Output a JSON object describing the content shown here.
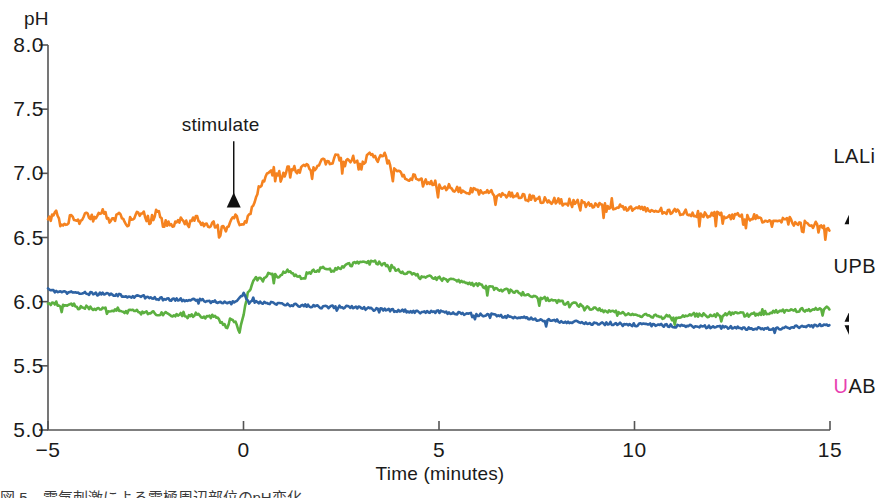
{
  "chart_data": {
    "type": "line",
    "title": "",
    "xlabel": "Time (minutes)",
    "ylabel": "pH",
    "ylabel_unit": "pH",
    "xlim": [
      -5,
      15
    ],
    "ylim": [
      5.0,
      8.0
    ],
    "grid": false,
    "legend_position": "right-inline-labels",
    "xticks": [
      -5,
      0,
      5,
      10,
      15
    ],
    "xtick_labels": [
      "−5",
      "0",
      "5",
      "10",
      "15"
    ],
    "yticks": [
      5.0,
      5.5,
      6.0,
      6.5,
      7.0,
      7.5,
      8.0
    ],
    "ytick_labels": [
      "5.0",
      "5.5",
      "6.0",
      "6.5",
      "7.0",
      "7.5",
      "8.0"
    ],
    "annotations": [
      {
        "text": "stimulate",
        "x": -0.25,
        "y": 7.35,
        "arrow_to_y": 6.85
      }
    ],
    "series": [
      {
        "name": "LALi",
        "color": "#F5821F",
        "label_x": 15.55,
        "label_y": 7.12,
        "arrow_from_y": 6.95,
        "arrow_to_y": 6.72,
        "x": [
          -5.0,
          -4.8,
          -4.6,
          -4.4,
          -4.2,
          -4.0,
          -3.8,
          -3.6,
          -3.4,
          -3.2,
          -3.0,
          -2.8,
          -2.6,
          -2.4,
          -2.2,
          -2.0,
          -1.8,
          -1.6,
          -1.4,
          -1.2,
          -1.0,
          -0.8,
          -0.6,
          -0.4,
          -0.2,
          0.0,
          0.2,
          0.4,
          0.6,
          0.8,
          1.0,
          1.2,
          1.4,
          1.6,
          1.8,
          2.0,
          2.2,
          2.4,
          2.6,
          2.8,
          3.0,
          3.2,
          3.4,
          3.6,
          3.8,
          4.0,
          4.2,
          4.4,
          4.6,
          4.8,
          5.0,
          5.5,
          6.0,
          6.5,
          7.0,
          7.5,
          8.0,
          8.5,
          9.0,
          9.5,
          10.0,
          10.5,
          11.0,
          11.5,
          12.0,
          12.5,
          13.0,
          13.5,
          14.0,
          14.5,
          15.0
        ],
        "y": [
          6.63,
          6.7,
          6.6,
          6.66,
          6.62,
          6.69,
          6.64,
          6.72,
          6.62,
          6.68,
          6.6,
          6.66,
          6.7,
          6.62,
          6.71,
          6.63,
          6.58,
          6.66,
          6.6,
          6.68,
          6.58,
          6.62,
          6.56,
          6.6,
          6.66,
          6.58,
          6.72,
          6.88,
          6.99,
          7.02,
          6.98,
          7.06,
          7.0,
          7.08,
          7.03,
          7.12,
          7.06,
          7.14,
          7.07,
          7.12,
          7.04,
          7.16,
          7.1,
          7.15,
          7.02,
          7.0,
          6.96,
          6.98,
          6.92,
          6.94,
          6.9,
          6.88,
          6.85,
          6.84,
          6.82,
          6.8,
          6.78,
          6.77,
          6.75,
          6.74,
          6.72,
          6.71,
          6.7,
          6.69,
          6.68,
          6.67,
          6.66,
          6.64,
          6.62,
          6.6,
          6.58
        ],
        "noise": 0.028
      },
      {
        "name": "UPB",
        "color": "#5CB040",
        "label_x": 15.55,
        "label_y": 6.26,
        "arrow_from_y": 6.12,
        "arrow_to_y": 5.96,
        "x": [
          -5.0,
          -4.8,
          -4.6,
          -4.4,
          -4.2,
          -4.0,
          -3.8,
          -3.6,
          -3.4,
          -3.2,
          -3.0,
          -2.8,
          -2.6,
          -2.4,
          -2.2,
          -2.0,
          -1.8,
          -1.6,
          -1.4,
          -1.2,
          -1.0,
          -0.8,
          -0.6,
          -0.4,
          -0.3,
          -0.2,
          -0.1,
          0.0,
          0.1,
          0.2,
          0.3,
          0.5,
          0.7,
          0.9,
          1.1,
          1.3,
          1.5,
          1.8,
          2.0,
          2.3,
          2.6,
          2.9,
          3.2,
          3.5,
          3.8,
          4.0,
          4.5,
          5.0,
          5.5,
          6.0,
          6.5,
          7.0,
          7.5,
          8.0,
          8.5,
          9.0,
          9.5,
          10.0,
          10.5,
          11.0,
          11.5,
          12.0,
          12.5,
          13.0,
          13.5,
          14.0,
          14.5,
          15.0
        ],
        "y": [
          5.97,
          5.99,
          5.96,
          5.98,
          5.95,
          5.96,
          5.94,
          5.95,
          5.93,
          5.94,
          5.92,
          5.93,
          5.91,
          5.92,
          5.9,
          5.91,
          5.89,
          5.9,
          5.88,
          5.91,
          5.87,
          5.89,
          5.85,
          5.8,
          5.88,
          5.83,
          5.76,
          5.9,
          6.06,
          6.14,
          6.18,
          6.16,
          6.22,
          6.19,
          6.24,
          6.21,
          6.18,
          6.24,
          6.26,
          6.24,
          6.28,
          6.3,
          6.32,
          6.3,
          6.27,
          6.24,
          6.2,
          6.18,
          6.16,
          6.13,
          6.1,
          6.07,
          6.04,
          6.0,
          5.98,
          5.94,
          5.92,
          5.9,
          5.89,
          5.88,
          5.9,
          5.89,
          5.91,
          5.9,
          5.92,
          5.93,
          5.94,
          5.95
        ],
        "noise": 0.015
      },
      {
        "name": "UAB",
        "color": "#2E63A4",
        "label_x": 15.55,
        "label_y": 5.33,
        "arrow_from_y": 5.5,
        "arrow_to_y": 5.7,
        "x": [
          -5.0,
          -4.7,
          -4.4,
          -4.1,
          -3.8,
          -3.5,
          -3.2,
          -2.9,
          -2.6,
          -2.3,
          -2.0,
          -1.7,
          -1.4,
          -1.1,
          -0.8,
          -0.5,
          -0.3,
          -0.1,
          0.0,
          0.1,
          0.3,
          0.6,
          1.0,
          1.5,
          2.0,
          2.5,
          3.0,
          3.5,
          4.0,
          4.5,
          5.0,
          5.5,
          6.0,
          6.5,
          7.0,
          7.5,
          8.0,
          8.5,
          9.0,
          9.5,
          10.0,
          10.5,
          11.0,
          11.5,
          12.0,
          12.5,
          13.0,
          13.5,
          14.0,
          14.5,
          15.0
        ],
        "y": [
          6.09,
          6.08,
          6.07,
          6.07,
          6.06,
          6.06,
          6.05,
          6.04,
          6.04,
          6.03,
          6.02,
          6.02,
          6.01,
          6.01,
          6.0,
          6.0,
          5.99,
          6.02,
          6.06,
          6.02,
          6.0,
          5.99,
          5.98,
          5.97,
          5.96,
          5.96,
          5.95,
          5.94,
          5.93,
          5.92,
          5.92,
          5.91,
          5.9,
          5.89,
          5.88,
          5.86,
          5.85,
          5.84,
          5.83,
          5.83,
          5.82,
          5.82,
          5.81,
          5.81,
          5.8,
          5.8,
          5.79,
          5.79,
          5.8,
          5.81,
          5.82
        ],
        "noise": 0.012
      }
    ]
  },
  "axis": {
    "y_unit_label": "pH",
    "x_title": "Time (minutes)"
  },
  "caption": {
    "text": "図 5　電気刺激による電極周辺部位のpH変化"
  }
}
